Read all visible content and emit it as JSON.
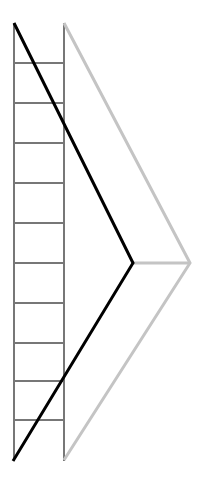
{
  "diagram": {
    "colors": {
      "background": "#ffffff",
      "ladder": "#777777",
      "black_line": "#000000",
      "gray_line": "#c4c4c4"
    },
    "ladder": {
      "left_rail_x": 14,
      "right_rail_x": 64,
      "top_y": 23,
      "bottom_y": 461,
      "rungs_y": [
        63,
        103,
        143,
        183,
        223,
        263,
        303,
        343,
        381,
        420
      ]
    },
    "black_chevron": {
      "points": [
        [
          14,
          23
        ],
        [
          133,
          263
        ],
        [
          13,
          461
        ]
      ]
    },
    "gray_chevron": {
      "points": [
        [
          64,
          23
        ],
        [
          190,
          263
        ],
        [
          64,
          460
        ]
      ],
      "crossbar": [
        [
          133,
          263
        ],
        [
          190,
          263
        ]
      ]
    }
  }
}
